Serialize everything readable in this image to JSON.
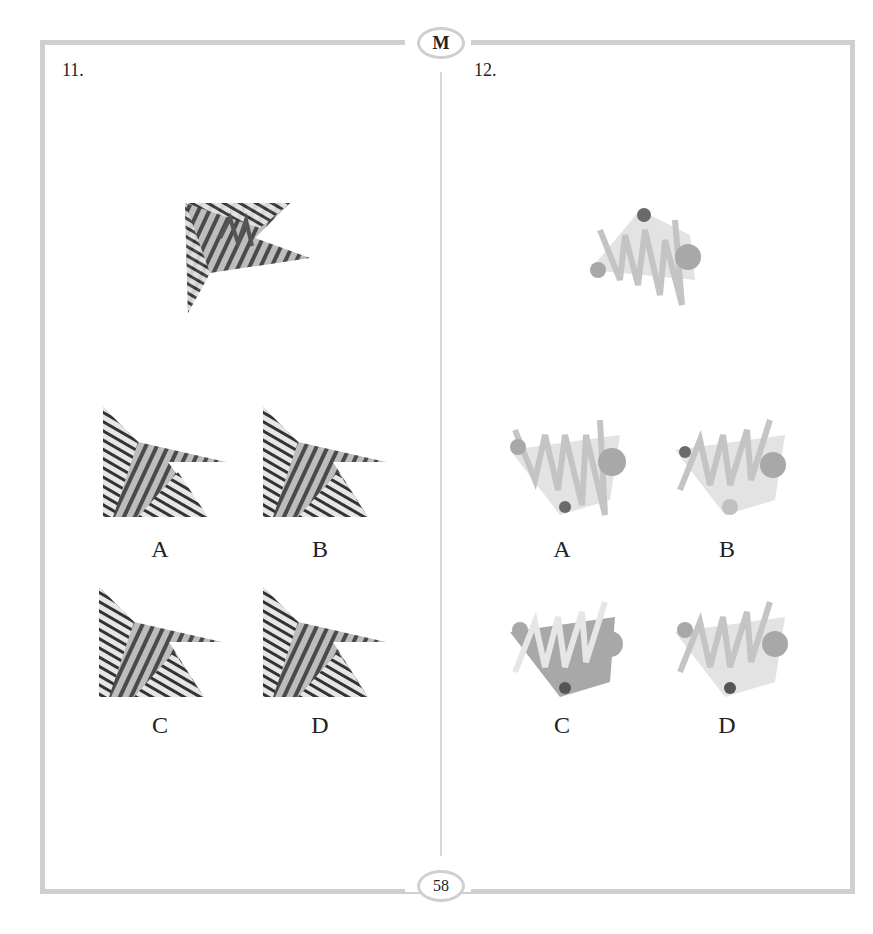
{
  "header": {
    "badge": "M"
  },
  "footer": {
    "page_number": "58"
  },
  "questions": [
    {
      "number": "11.",
      "stem_figure": "fragmented-arrowhead-striped",
      "options": [
        {
          "label": "A"
        },
        {
          "label": "B"
        },
        {
          "label": "C"
        },
        {
          "label": "D"
        }
      ]
    },
    {
      "number": "12.",
      "stem_figure": "zigzag-with-circles-on-trapezoid",
      "options": [
        {
          "label": "A"
        },
        {
          "label": "B"
        },
        {
          "label": "C"
        },
        {
          "label": "D"
        }
      ]
    }
  ],
  "colors": {
    "frame": "#cfcfcf",
    "dark_stripe": "#3a3a3a",
    "mid_gray": "#7a7a7a",
    "light_gray": "#bdbdbd",
    "pale_fill": "#e3e3e3",
    "dark_circle": "#6a6a6a",
    "mid_circle": "#a8a8a8"
  }
}
